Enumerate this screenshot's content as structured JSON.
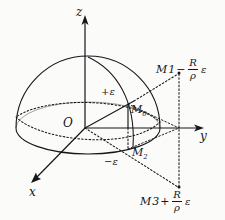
{
  "figure": {
    "background_color": "#fbfbf9",
    "stroke_color": "#16161a",
    "axes": {
      "z_label": "z",
      "y_label": "y",
      "x_label": "x",
      "origin_label": "O"
    },
    "points": {
      "m0_label": "M",
      "m0_sub": "0",
      "m1_label": "M",
      "m1_sub": "1",
      "m2_label": "M",
      "m2_sub": "2",
      "m3_label": "M",
      "m3_sub": "3"
    },
    "annotations": {
      "eps_plus": "+ε",
      "eps_minus": "−ε",
      "expr_m1": {
        "point": "M",
        "point_sub": "1",
        "operator": "−",
        "numerator": "R",
        "denominator": "ρ",
        "factor": "ε"
      },
      "expr_m3": {
        "point": "M",
        "point_sub": "3",
        "operator": "+",
        "numerator": "R",
        "denominator": "ρ",
        "factor": "ε"
      }
    },
    "geometry": {
      "origin": [
        85,
        128
      ],
      "dome_left": [
        16,
        128
      ],
      "dome_right": [
        160,
        128
      ],
      "dome_top": [
        88,
        57
      ],
      "z_axis_tip": [
        85,
        18
      ],
      "y_axis_tip": [
        203,
        128
      ],
      "x_axis_tip": [
        32,
        182
      ],
      "m0_point": [
        128,
        128
      ],
      "m1_point": [
        179,
        72
      ],
      "m2_point": [
        128,
        145
      ],
      "m3_point": [
        179,
        188
      ]
    }
  }
}
